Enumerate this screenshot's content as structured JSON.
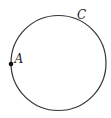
{
  "diagram": {
    "type": "geometry",
    "circle": {
      "cx": 58.5,
      "cy": 63,
      "r": 47.5,
      "stroke": "#333333"
    },
    "points": [
      {
        "label": "A",
        "x": 11,
        "y": 64,
        "dot": true,
        "label_x": 14.5,
        "label_y": 63
      },
      {
        "label": "C",
        "x": 80,
        "y": 20,
        "dot": false,
        "label_x": 77,
        "label_y": 19
      }
    ]
  }
}
